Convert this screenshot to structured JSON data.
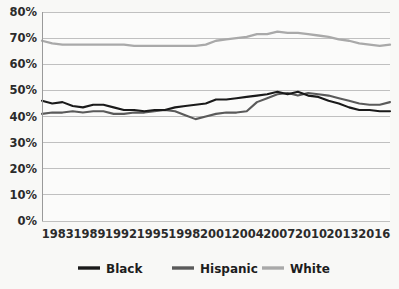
{
  "chart_data": {
    "type": "line",
    "title": "",
    "subtitle": "",
    "xlabel": "",
    "ylabel": "",
    "ylim": [
      0,
      80
    ],
    "ytick_labels": [
      "0%",
      "10%",
      "20%",
      "30%",
      "40%",
      "50%",
      "60%",
      "70%",
      "80%"
    ],
    "ytick_values": [
      0,
      10,
      20,
      30,
      40,
      50,
      60,
      70,
      80
    ],
    "xtick_labels": [
      "1983",
      "1989",
      "1992",
      "1995",
      "1998",
      "2001",
      "2004",
      "2007",
      "2010",
      "2013",
      "2016"
    ],
    "grid": "horizontal",
    "legend_position": "bottom",
    "x": [
      1983,
      1984,
      1985,
      1986,
      1987,
      1988,
      1989,
      1990,
      1991,
      1992,
      1993,
      1994,
      1995,
      1996,
      1997,
      1998,
      1999,
      2000,
      2001,
      2002,
      2003,
      2004,
      2005,
      2006,
      2007,
      2008,
      2009,
      2010,
      2011,
      2012,
      2013,
      2014,
      2015,
      2016,
      2017
    ],
    "series": [
      {
        "name": "Black",
        "color": "#1a1a1a",
        "values": [
          46.0,
          45.0,
          45.5,
          44.0,
          43.5,
          44.5,
          44.5,
          43.5,
          42.5,
          42.5,
          42.0,
          42.5,
          42.5,
          43.5,
          44.0,
          44.5,
          45.0,
          46.5,
          46.5,
          47.0,
          47.5,
          48.0,
          48.5,
          49.5,
          48.5,
          49.5,
          48.0,
          47.5,
          46.0,
          45.0,
          43.5,
          42.5,
          42.5,
          42.0,
          42.0
        ]
      },
      {
        "name": "Hispanic",
        "color": "#5a5a5a",
        "values": [
          41.0,
          41.5,
          41.5,
          42.0,
          41.5,
          42.0,
          42.0,
          41.0,
          41.0,
          41.5,
          41.5,
          42.0,
          42.5,
          42.0,
          40.5,
          39.0,
          40.0,
          41.0,
          41.5,
          41.5,
          42.0,
          45.5,
          47.0,
          48.5,
          49.0,
          48.0,
          49.0,
          48.5,
          48.0,
          47.0,
          46.0,
          45.0,
          44.5,
          44.5,
          45.5
        ]
      },
      {
        "name": "White",
        "color": "#a9a9a9",
        "values": [
          69.0,
          68.0,
          67.5,
          67.5,
          67.5,
          67.5,
          67.5,
          67.5,
          67.5,
          67.0,
          67.0,
          67.0,
          67.0,
          67.0,
          67.0,
          67.0,
          67.5,
          69.0,
          69.5,
          70.0,
          70.5,
          71.5,
          71.5,
          72.5,
          72.0,
          72.0,
          71.5,
          71.0,
          70.5,
          69.5,
          69.0,
          68.0,
          67.5,
          67.0,
          67.5
        ]
      }
    ],
    "legend": [
      {
        "label": "Black",
        "color": "#1a1a1a"
      },
      {
        "label": "Hispanic",
        "color": "#5a5a5a"
      },
      {
        "label": "White",
        "color": "#a9a9a9"
      }
    ]
  }
}
